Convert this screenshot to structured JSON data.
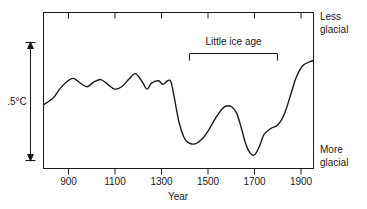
{
  "chart_data": {
    "type": "line",
    "title": "",
    "xlabel": "Year",
    "ylabel": ".5°C",
    "xlim": [
      800,
      1975
    ],
    "ylim": [
      0,
      1
    ],
    "grid": false,
    "legend": null,
    "x_ticks": [
      900,
      1100,
      1300,
      1500,
      1700,
      1900
    ],
    "x_tick_labels": [
      "900",
      "1100",
      "1300",
      "1500",
      "1700",
      "1900"
    ],
    "y_axis_annotations": {
      "top": "Less\nglacial",
      "top_line1": "Less",
      "top_line2": "glacial",
      "bottom": "More\nglacial",
      "bottom_line1": "More",
      "bottom_line2": "glacial"
    },
    "scale_bar": {
      "label": ".5°C",
      "value": 0.5,
      "units": "°C",
      "style": "double-headed-arrow"
    },
    "annotations": [
      {
        "label": "Little ice age",
        "type": "bracket",
        "x_start": 1420,
        "x_end": 1810
      }
    ],
    "series": [
      {
        "name": "Relative glacial extent / temperature",
        "x": [
          800,
          840,
          870,
          900,
          930,
          960,
          990,
          1020,
          1050,
          1080,
          1110,
          1140,
          1170,
          1200,
          1230,
          1250,
          1270,
          1300,
          1320,
          1340,
          1355,
          1370,
          1390,
          1410,
          1430,
          1460,
          1490,
          1520,
          1550,
          1580,
          1600,
          1620,
          1640,
          1660,
          1680,
          1700,
          1720,
          1740,
          1760,
          1790,
          1820,
          1850,
          1880,
          1900,
          1930,
          1960,
          1975
        ],
        "values": [
          0.47,
          0.52,
          0.6,
          0.66,
          0.69,
          0.65,
          0.62,
          0.66,
          0.68,
          0.64,
          0.6,
          0.62,
          0.68,
          0.73,
          0.66,
          0.6,
          0.65,
          0.67,
          0.64,
          0.67,
          0.66,
          0.52,
          0.32,
          0.2,
          0.15,
          0.14,
          0.18,
          0.26,
          0.36,
          0.44,
          0.46,
          0.45,
          0.4,
          0.28,
          0.14,
          0.06,
          0.05,
          0.12,
          0.22,
          0.27,
          0.3,
          0.4,
          0.58,
          0.7,
          0.8,
          0.83,
          0.84
        ]
      }
    ],
    "colors": {
      "line": "#1a1a1a",
      "axis": "#1a1a1a",
      "background": "#ffffff",
      "text": "#1a1a1a"
    }
  },
  "labels": {
    "scale": ".5°C",
    "annotation": "Little ice age",
    "axis_x_title": "Year",
    "top_right_line1": "Less",
    "top_right_line2": "glacial",
    "bottom_right_line1": "More",
    "bottom_right_line2": "glacial",
    "tick_900": "900",
    "tick_1100": "1100",
    "tick_1300": "1300",
    "tick_1500": "1500",
    "tick_1700": "1700",
    "tick_1900": "1900"
  }
}
